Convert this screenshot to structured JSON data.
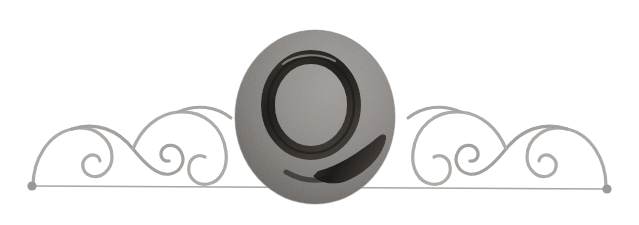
{
  "figure": {
    "kind": "decorative-typographic-ornament",
    "width": 639,
    "height": 225,
    "background_color": "#ffffff",
    "rendering": "halftone-engraving-scan",
    "symmetry": "mirror-horizontal"
  },
  "initial": {
    "letter": "Q",
    "role": "drop-cap-initial",
    "stroke_color": "#2b2724",
    "bowl": {
      "center_x": 311,
      "center_y": 105,
      "radius_x": 43,
      "radius_y": 48,
      "stroke_width": 13
    },
    "tail": {
      "description": "thick diagonal tail sweeping down to the right",
      "start_x": 281,
      "start_y": 176,
      "end_x": 381,
      "end_y": 140
    }
  },
  "medallion": {
    "shape": "ellipse",
    "center_x": 315,
    "center_y": 117,
    "radius_x": 80,
    "radius_y": 87,
    "fill_light": "#a7a3a0",
    "fill_mid": "#8e8a87",
    "fill_dark": "#6f6b68",
    "highlight_direction": "upper-right",
    "shadow_direction": "lower-left"
  },
  "scrollwork": {
    "stroke_color": "#b3b0ad",
    "stroke_color_dark": "#9a9794",
    "stroke_width": 3.2,
    "baseline_y": 113,
    "side_count": 2,
    "spirals_per_side": 3,
    "description": "symmetric arcs curling into inward spirals on both sides of the medallion"
  },
  "rule": {
    "color": "#a9a6a3",
    "thickness": 1.4,
    "left_x": 33,
    "left_y": 186,
    "right_x": 606,
    "right_y": 189,
    "terminal": {
      "shape": "dot",
      "color": "#9b9895",
      "radius": 4.5
    }
  },
  "labels": {
    "alt_text": "Ornamental chapter heading: a large illuminated letter Q set on a round shaded medallion, flanked by symmetrical curling filigree scrolls above a thin horizontal rule ending in small dots.",
    "caption": "Illuminated initial Q"
  }
}
